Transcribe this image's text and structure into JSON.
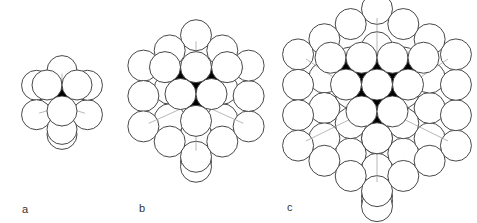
{
  "figure": {
    "panels": [
      {
        "label": "a",
        "label_pos": [
          22,
          203
        ],
        "cx": 62,
        "cy": 100,
        "r": 15,
        "shells": 1
      },
      {
        "label": "b",
        "label_pos": [
          139,
          202
        ],
        "cx": 196,
        "cy": 96,
        "r": 15.5,
        "shells": 2
      },
      {
        "label": "c",
        "label_pos": [
          287,
          201
        ],
        "cx": 377,
        "cy": 100,
        "r": 15.5,
        "shells": 3
      }
    ],
    "colors": {
      "stroke": "#333333",
      "edge": "#9a9a9a",
      "void": "#000000",
      "fill": "#ffffff"
    }
  }
}
